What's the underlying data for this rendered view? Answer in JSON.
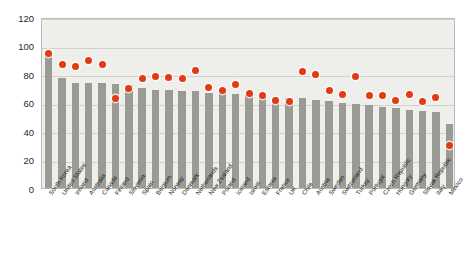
{
  "chart_data": {
    "type": "bar",
    "title": "",
    "subtitle": "",
    "xlabel": "",
    "ylabel": "",
    "ylim": [
      0,
      120
    ],
    "yticks": [
      0,
      20,
      40,
      60,
      80,
      100,
      120
    ],
    "grid": true,
    "legend": "none",
    "categories": [
      "South Korea",
      "United States",
      "Ireland",
      "Australia",
      "Canada",
      "Finland",
      "Slovenia",
      "Spain",
      "Belgium",
      "Norway",
      "Denmark",
      "Netherlands",
      "New Zealand",
      "Poland",
      "Iceland",
      "Israel",
      "Estonia",
      "France",
      "UK",
      "Chile",
      "Austria",
      "Sweden",
      "Switzerland",
      "Turkey",
      "Portugal",
      "Czech Republic",
      "Hungary",
      "Germany",
      "Slovak Republic",
      "Italy",
      "Mexico"
    ],
    "series": [
      {
        "name": "bars",
        "marker": "bar",
        "color": "#9b9b96",
        "values": [
          95,
          77,
          74,
          74,
          74,
          73,
          72,
          70,
          69,
          69,
          68,
          68,
          67,
          67,
          66,
          66,
          65,
          64,
          63,
          63,
          62,
          61,
          60,
          59,
          58,
          57,
          56,
          55,
          54,
          53,
          45
        ]
      },
      {
        "name": "dots",
        "marker": "circle",
        "color": "#e23b12",
        "values": [
          96,
          88,
          87,
          91,
          88,
          64,
          71,
          78,
          80,
          79,
          78,
          84,
          72,
          70,
          74,
          68,
          66,
          63,
          62,
          83,
          81,
          70,
          67,
          80,
          66,
          66,
          63,
          67,
          62,
          65,
          31
        ]
      }
    ]
  }
}
